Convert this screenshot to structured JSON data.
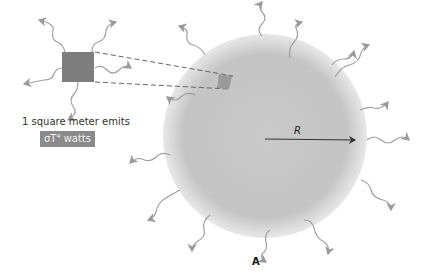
{
  "diagram": {
    "emission_text": "1 square meter emits",
    "power_label": "σT⁴ watts",
    "radius_label": "R",
    "panel_label": "A",
    "colors": {
      "sphere": "#bdbdbd",
      "square": "#7d7d7d",
      "arrows": "#9a9a9a",
      "label_box": "#8a8a8a"
    }
  }
}
